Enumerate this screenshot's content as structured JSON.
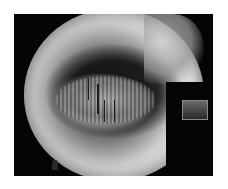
{
  "image": {
    "description": "Grayscale fisheye tiny-planet style photograph of trees within a black rectangular frame",
    "colors": {
      "background": "#ffffff",
      "frame": "#050505",
      "highlight": "#e8e8e8",
      "midtone": "#8a8a8a",
      "shadow": "#1e1e1e"
    }
  }
}
